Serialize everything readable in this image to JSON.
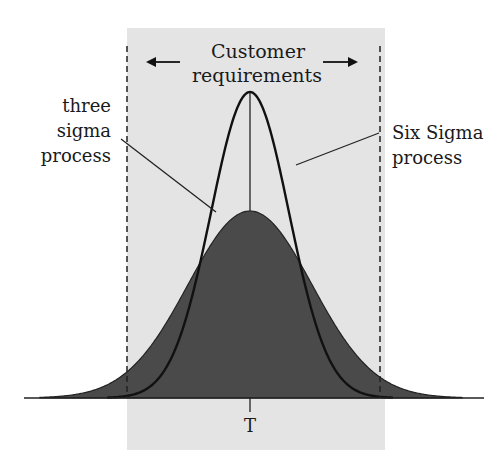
{
  "diagram": {
    "type": "normal-distribution-comparison",
    "region_label_line1": "Customer",
    "region_label_line2": "requirements",
    "left_label_line1": "three",
    "left_label_line2": "sigma",
    "left_label_line3": "process",
    "right_label_line1": "Six Sigma",
    "right_label_line2": "process",
    "target_label": "T",
    "colors": {
      "background": "#ffffff",
      "spec_region": "#e4e4e4",
      "three_sigma_fill": "#4a4a4a",
      "curve_stroke": "#111111"
    },
    "curves": [
      {
        "name": "Six Sigma process",
        "shape": "tall narrow bell",
        "filled": false
      },
      {
        "name": "three sigma process",
        "shape": "short wide bell",
        "filled": true
      }
    ],
    "arrows": [
      "left",
      "right"
    ]
  }
}
